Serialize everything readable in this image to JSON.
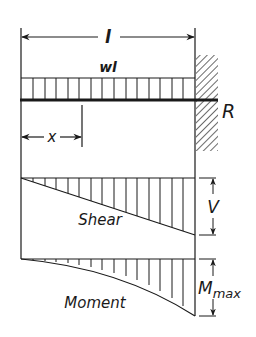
{
  "diagram": {
    "type": "cantilever-beam-uniform-load",
    "labels": {
      "span": "l",
      "load": "wl",
      "reaction": "R",
      "distance": "x",
      "shear_dimension": "V",
      "moment_dimension_main": "M",
      "moment_dimension_sub": "max",
      "shear_diagram": "Shear",
      "moment_diagram": "Moment"
    },
    "colors": {
      "ink": "#1a1a1a",
      "background": "#ffffff"
    }
  }
}
